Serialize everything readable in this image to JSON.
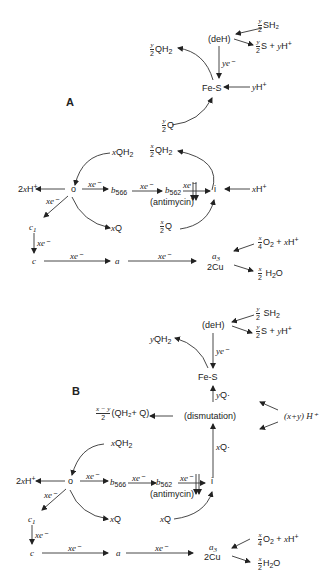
{
  "panelA": {
    "label": "A",
    "deh": "(deH)",
    "sh2": "SH₂",
    "y_num": "y",
    "two": "2",
    "s_plus_yh": "S + ",
    "yh_y": "y",
    "yh_h": "H",
    "plus": "+",
    "qh2_half": "QH",
    "ye": "ye⁻",
    "fes": "Fe-S",
    "yh_in_y": "y",
    "yh_in_h": "H",
    "q_half": "Q",
    "xqh2_x": "x",
    "xqh2": "QH",
    "x_num": "x",
    "xqh2_half": "QH",
    "two_xh": "2",
    "two_xh_x": "x",
    "two_xh_h": "H",
    "o": "o",
    "xe": "xe⁻",
    "b566_b": "b",
    "b566_sub": "566",
    "b562_b": "b",
    "b562_sub": "562",
    "antimycin": "(antimycin)",
    "i": "i",
    "xh_x": "x",
    "xh_h": "H",
    "xq_x": "x",
    "xq_q": "Q",
    "xq_half_q": "Q",
    "c1": "c",
    "c1_sub": "1",
    "c": "c",
    "a": "a",
    "a3": "a",
    "a3_sub": "3",
    "cu": "2Cu",
    "four": "4",
    "o2": "O",
    "o2_sub": "2",
    "o2_plus": " + ",
    "xh2_x": "x",
    "xh2_h": "H",
    "h2o": "H",
    "h2o_sub": "2",
    "h2o_o": "O",
    "sub2": "2"
  },
  "panelB": {
    "label": "B",
    "deh": "(deH)",
    "sh2": "SH",
    "sub2": "2",
    "y_num": "y",
    "two": "2",
    "s_plus": "S + ",
    "y": "y",
    "h": "H",
    "plus": "+",
    "yqh2_y": "y",
    "yqh2": "QH",
    "ye": "ye⁻",
    "fes": "Fe-S",
    "yq_y": "y",
    "yq": "Q·",
    "dismutation": "(dismutation)",
    "xmy_num": "x − y",
    "qh2q": "(QH₂+ Q)",
    "xy_h": "(x+y) H⁺",
    "xq_up_x": "x",
    "xq_up": "Q·",
    "xqh2_x": "x",
    "xqh2": "QH",
    "two_xh": "2",
    "x": "x",
    "o": "o",
    "xe": "xe⁻",
    "b566_b": "b",
    "b566_sub": "566",
    "b562_b": "b",
    "b562_sub": "562",
    "antimycin": "(antimycin)",
    "i": "i",
    "xq_x": "x",
    "xq_q": "Q",
    "c1": "c",
    "c1_sub": "1",
    "c": "c",
    "a": "a",
    "a3": "a",
    "a3_sub": "3",
    "cu": "2Cu",
    "four": "4",
    "o2": "O",
    "o2_plus": " + ",
    "h2o": "H",
    "h2o_o": "O"
  }
}
